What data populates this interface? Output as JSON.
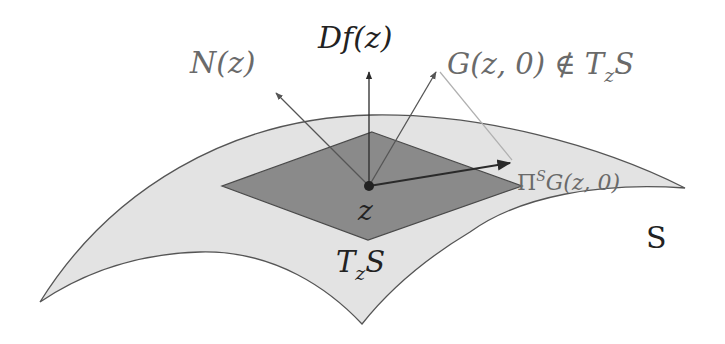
{
  "figure": {
    "labels": {
      "df": "Df(z)",
      "normal": "N(z)",
      "g_vector": "G(z, 0) ∉ T",
      "g_vector_sub": "z",
      "g_vector_tail": "S",
      "projection_pi": "Π",
      "projection_sup": "S",
      "projection_rest": "G(z, 0)",
      "point": "z",
      "tangent_T": "T",
      "tangent_sub": "z",
      "tangent_S": "S",
      "surface": "S"
    },
    "colors": {
      "surface_fill": "#e3e3e3",
      "surface_stroke": "#555555",
      "plane_fill": "#8a8a8a",
      "plane_stroke": "#4a4a4a",
      "arrow_dark": "#2a2a2a",
      "arrow_gray": "#7a7a7a",
      "projection_line": "#b0b0b0"
    }
  }
}
